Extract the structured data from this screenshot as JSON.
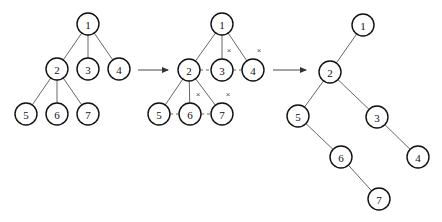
{
  "diagram": {
    "node_radius": 11,
    "colors": {
      "node_stroke": "#111111",
      "edge": "#555555",
      "background": "#ffffff"
    },
    "panels": [
      {
        "id": "original-tree",
        "nodes": [
          {
            "id": "1",
            "label": "1",
            "x": 88,
            "y": 24
          },
          {
            "id": "2",
            "label": "2",
            "x": 57,
            "y": 69
          },
          {
            "id": "3",
            "label": "3",
            "x": 88,
            "y": 69
          },
          {
            "id": "4",
            "label": "4",
            "x": 119,
            "y": 69
          },
          {
            "id": "5",
            "label": "5",
            "x": 26,
            "y": 114
          },
          {
            "id": "6",
            "label": "6",
            "x": 57,
            "y": 114
          },
          {
            "id": "7",
            "label": "7",
            "x": 88,
            "y": 114
          }
        ],
        "edges": [
          [
            "1",
            "2"
          ],
          [
            "1",
            "3"
          ],
          [
            "1",
            "4"
          ],
          [
            "2",
            "5"
          ],
          [
            "2",
            "6"
          ],
          [
            "2",
            "7"
          ]
        ],
        "dashed_edges": [],
        "cut_marks": []
      },
      {
        "id": "sibling-linked-tree",
        "nodes": [
          {
            "id": "1",
            "label": "1",
            "x": 222,
            "y": 24
          },
          {
            "id": "2",
            "label": "2",
            "x": 189,
            "y": 70
          },
          {
            "id": "3",
            "label": "3",
            "x": 222,
            "y": 70
          },
          {
            "id": "4",
            "label": "4",
            "x": 253,
            "y": 70
          },
          {
            "id": "5",
            "label": "5",
            "x": 159,
            "y": 114
          },
          {
            "id": "6",
            "label": "6",
            "x": 190,
            "y": 114
          },
          {
            "id": "7",
            "label": "7",
            "x": 222,
            "y": 114
          }
        ],
        "edges": [
          [
            "1",
            "2"
          ],
          [
            "1",
            "3"
          ],
          [
            "1",
            "4"
          ],
          [
            "2",
            "5"
          ],
          [
            "2",
            "6"
          ],
          [
            "2",
            "7"
          ]
        ],
        "dashed_edges": [
          [
            "2",
            "3"
          ],
          [
            "3",
            "4"
          ],
          [
            "5",
            "6"
          ],
          [
            "6",
            "7"
          ]
        ],
        "cut_marks": [
          {
            "label": "×",
            "x": 229,
            "y": 50
          },
          {
            "label": "×",
            "x": 259,
            "y": 50
          },
          {
            "label": "×",
            "x": 198,
            "y": 94
          },
          {
            "label": "×",
            "x": 228,
            "y": 94
          }
        ]
      },
      {
        "id": "binary-tree",
        "nodes": [
          {
            "id": "1",
            "label": "1",
            "x": 363,
            "y": 25
          },
          {
            "id": "2",
            "label": "2",
            "x": 330,
            "y": 72
          },
          {
            "id": "5",
            "label": "5",
            "x": 298,
            "y": 116
          },
          {
            "id": "3",
            "label": "3",
            "x": 377,
            "y": 117
          },
          {
            "id": "6",
            "label": "6",
            "x": 341,
            "y": 157
          },
          {
            "id": "4",
            "label": "4",
            "x": 418,
            "y": 157
          },
          {
            "id": "7",
            "label": "7",
            "x": 379,
            "y": 199
          }
        ],
        "edges": [
          [
            "1",
            "2"
          ],
          [
            "2",
            "5"
          ],
          [
            "2",
            "3"
          ],
          [
            "5",
            "6"
          ],
          [
            "3",
            "4"
          ],
          [
            "6",
            "7"
          ]
        ],
        "dashed_edges": [],
        "cut_marks": []
      }
    ],
    "arrows": [
      {
        "id": "arrow-1",
        "x1": 138,
        "y1": 70,
        "x2": 168,
        "y2": 70
      },
      {
        "id": "arrow-2",
        "x1": 273,
        "y1": 70,
        "x2": 306,
        "y2": 70
      }
    ]
  }
}
